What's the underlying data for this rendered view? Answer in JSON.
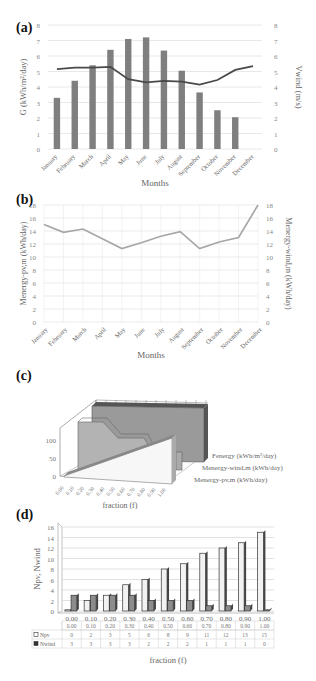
{
  "panels": {
    "a": {
      "label": "(a)"
    },
    "b": {
      "label": "(b)"
    },
    "c": {
      "label": "(c)"
    },
    "d": {
      "label": "(d)"
    }
  },
  "chart_data": [
    {
      "id": "a",
      "type": "bar+line",
      "title": "",
      "categories": [
        "January",
        "February",
        "March",
        "April",
        "May",
        "June",
        "July",
        "August",
        "September",
        "October",
        "November",
        "December"
      ],
      "series": [
        {
          "name": "G (kWh/m²/day)",
          "type": "bar",
          "axis": "left",
          "values": [
            3.3,
            4.4,
            5.4,
            6.4,
            7.1,
            7.2,
            6.35,
            5.05,
            3.65,
            2.5,
            2.05,
            0
          ]
        },
        {
          "name": "Vwind (m/s)",
          "type": "line",
          "axis": "right",
          "values": [
            5.15,
            5.25,
            5.25,
            5.3,
            4.5,
            4.3,
            4.4,
            4.35,
            4.15,
            4.45,
            5.1,
            5.35
          ]
        }
      ],
      "xlabel": "Months",
      "ylabel": "G (kWh/m²/day)",
      "y2label": "Vwind (m/s)",
      "ylim": [
        0,
        8
      ],
      "y2lim": [
        0,
        8
      ],
      "yticks": [
        0,
        1,
        2,
        3,
        4,
        5,
        6,
        7,
        8
      ],
      "grid": true
    },
    {
      "id": "b",
      "type": "line",
      "categories": [
        "January",
        "February",
        "March",
        "April",
        "May",
        "June",
        "July",
        "August",
        "September",
        "October",
        "November",
        "December"
      ],
      "series": [
        {
          "name": "Menergy-pv,m (kWh/day)",
          "axis": "left",
          "values": [
            15.0,
            13.8,
            14.3,
            12.8,
            11.3,
            12.2,
            13.2,
            13.9,
            11.3,
            12.3,
            13.0,
            18.0
          ]
        }
      ],
      "xlabel": "Months",
      "ylabel": "Menergy-pv,m (kWh/day)",
      "y2label": "Menergy-wind,m (kWh/day)",
      "ylim": [
        0,
        18
      ],
      "y2lim": [
        0,
        18
      ],
      "yticks": [
        0,
        2,
        4,
        6,
        8,
        10,
        12,
        14,
        16,
        18
      ],
      "grid": true
    },
    {
      "id": "c",
      "type": "area3d",
      "categories": [
        "0.00",
        "0.10",
        "0.20",
        "0.30",
        "0.40",
        "0.50",
        "0.60",
        "0.70",
        "0.80",
        "0.90",
        "1.00"
      ],
      "series": [
        {
          "name": "Fenergy (kWh/m²/day)",
          "values": [
            150,
            150,
            150,
            150,
            150,
            150,
            150,
            150,
            150,
            150,
            150
          ]
        },
        {
          "name": "Menergy-wind,m (kWh/day)",
          "values": [
            120,
            120,
            120,
            120,
            100,
            85,
            85,
            85,
            70,
            30,
            0
          ]
        },
        {
          "name": "Menergy-pv,m (kWh/day)",
          "values": [
            0,
            10,
            20,
            30,
            40,
            50,
            60,
            70,
            80,
            90,
            100
          ]
        }
      ],
      "xlabel": "fraction (f)",
      "zticks": [
        0,
        50,
        100
      ],
      "legend": [
        "Fenergy (kWh/m²/day)",
        "Menergy-wind,m (kWh/day)",
        "Menergy-pv,m (kWh/day)"
      ]
    },
    {
      "id": "d",
      "type": "bar",
      "categories": [
        "0.00",
        "0.10",
        "0.20",
        "0.30",
        "0.40",
        "0.50",
        "0.60",
        "0.70",
        "0.80",
        "0.90",
        "1.00"
      ],
      "series": [
        {
          "name": "Npv",
          "values": [
            0,
            2,
            3,
            5,
            6,
            8,
            9,
            11,
            12,
            13,
            15
          ],
          "color": "#f2f2f2"
        },
        {
          "name": "Nwind",
          "values": [
            3,
            3,
            3,
            3,
            2,
            2,
            2,
            1,
            1,
            1,
            0
          ],
          "color": "#8c8c8c"
        }
      ],
      "xlabel": "fraction (f)",
      "ylabel": "Npv, Nwind",
      "ylim": [
        0,
        16
      ],
      "yticks": [
        0,
        2,
        4,
        6,
        8,
        10,
        12,
        14,
        16
      ],
      "grid": true,
      "data_table": true
    }
  ]
}
